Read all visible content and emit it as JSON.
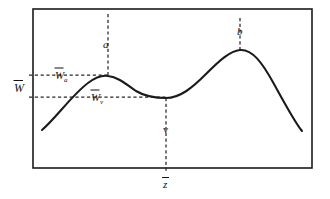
{
  "figure": {
    "kind": "line-diagram",
    "background_color": "#ffffff",
    "ink_color": "#1b1b1b",
    "frame": {
      "x": 33,
      "y": 9,
      "width": 279,
      "height": 159
    }
  },
  "labels": {
    "axis_w": {
      "text": "W",
      "accent": "macron",
      "x": 20,
      "y": 88
    },
    "w_a": {
      "text": "W",
      "accent": "macron",
      "subscript": "a",
      "x": 60,
      "y": 75
    },
    "w_v": {
      "text": "W",
      "accent": "macron",
      "subscript": "v",
      "x": 95,
      "y": 97
    },
    "point_a": {
      "text": "a",
      "x": 103,
      "y": 45
    },
    "point_b": {
      "text": "b",
      "x": 237,
      "y": 32
    },
    "point_v": {
      "text": "v",
      "x": 164,
      "y": 131
    },
    "axis_z": {
      "text": "z",
      "accent": "macron",
      "x": 164,
      "y": 184
    }
  },
  "chart_data": {
    "type": "line",
    "title": "",
    "xlabel": "z",
    "ylabel": "W",
    "grid": false,
    "legend": null,
    "xlim": [
      33,
      312
    ],
    "ylim": [
      168,
      9
    ],
    "annotations": [
      {
        "name": "a",
        "role": "local-maximum",
        "x": 108,
        "y": 76
      },
      {
        "name": "v",
        "role": "local-minimum",
        "x": 166,
        "y": 98
      },
      {
        "name": "b",
        "role": "global-maximum",
        "x": 240,
        "y": 50
      }
    ],
    "curve_path": "M 42,130 C 56,118 72,95 88,83 C 96,77 102,75 108,76 C 118,77 126,84 136,91 C 146,97 156,98 166,98 C 180,98 192,88 206,74 C 220,60 230,51 240,50 C 252,49 262,62 274,84 C 286,106 296,124 302,131",
    "guides": [
      {
        "name": "w-a-level",
        "orientation": "horizontal",
        "from": [
          29,
          75
        ],
        "to": [
          110,
          75
        ]
      },
      {
        "name": "w-v-level",
        "orientation": "horizontal",
        "from": [
          29,
          97
        ],
        "to": [
          168,
          97
        ]
      },
      {
        "name": "a-vertical",
        "orientation": "vertical",
        "from": [
          108,
          14
        ],
        "to": [
          108,
          76
        ]
      },
      {
        "name": "b-vertical",
        "orientation": "vertical",
        "from": [
          240,
          18
        ],
        "to": [
          240,
          50
        ]
      },
      {
        "name": "v-vertical",
        "orientation": "vertical",
        "from": [
          166,
          98
        ],
        "to": [
          166,
          172
        ]
      }
    ]
  }
}
